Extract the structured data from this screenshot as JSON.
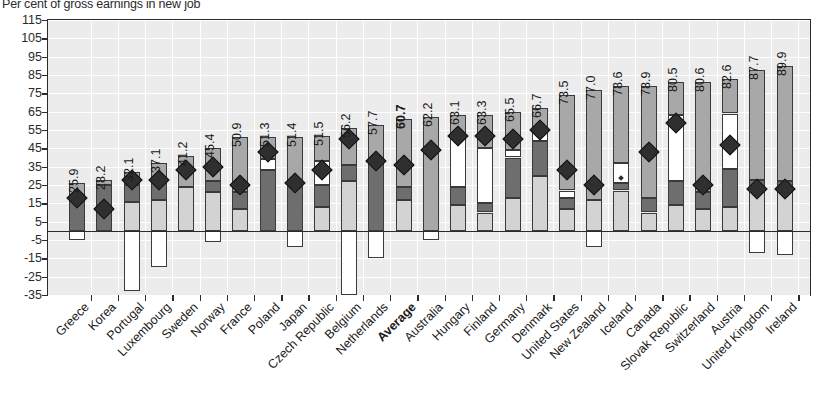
{
  "chart_data": {
    "type": "bar",
    "title": "Per cent of gross earnings in new job",
    "xlabel": "",
    "ylabel": "",
    "ylim": [
      -35,
      115
    ],
    "ytick_step": 10,
    "grid": true,
    "stacked": true,
    "legend_position": "below-chart",
    "ytick_labels": [
      "115",
      "105",
      "95",
      "85",
      "75",
      "65",
      "55",
      "45",
      "35",
      "25",
      "15",
      "5",
      "-5",
      "-15",
      "-25",
      "-35"
    ],
    "categories": [
      "Greece",
      "Korea",
      "Portugal",
      "Luxembourg",
      "Sweden",
      "Norway",
      "France",
      "Poland",
      "Japan",
      "Czech Republic",
      "Belgium",
      "Netherlands",
      "Average",
      "Australia",
      "Hungary",
      "Finland",
      "Germany",
      "Denmark",
      "United States",
      "New Zealand",
      "Iceland",
      "Canada",
      "Slovak Republic",
      "Switzerland",
      "Austria",
      "United Kingdom",
      "Ireland"
    ],
    "data_labels": [
      "25.9",
      "28.2",
      "32.1",
      "37.1",
      "41.2",
      "45.4",
      "50.9",
      "51.3",
      "51.4",
      "51.5",
      "56.2",
      "57.7",
      "60.7",
      "62.2",
      "63.1",
      "63.3",
      "65.5",
      "66.7",
      "73.5",
      "77.0",
      "78.6",
      "78.9",
      "80.5",
      "80.6",
      "82.6",
      "87.7",
      "89.9"
    ],
    "highlight_category": "Average",
    "series": [
      {
        "name": "negative-segment",
        "color": "#ffffff",
        "values": [
          -5.0,
          0.0,
          -33.0,
          -20.0,
          0.0,
          -6.0,
          0.0,
          0.0,
          -9.0,
          0.0,
          -35.0,
          -15.0,
          0.0,
          -5.0,
          0.0,
          0.0,
          0.0,
          0.0,
          0.0,
          -9.0,
          0.0,
          0.0,
          0.0,
          0.0,
          0.0,
          -12.0,
          -13.0
        ]
      },
      {
        "name": "segment-1-light",
        "color": "#d3d3d3",
        "values": [
          0.0,
          0.0,
          16.0,
          17.0,
          24.0,
          21.0,
          12.0,
          0.0,
          0.0,
          13.0,
          27.0,
          0.0,
          17.0,
          0.0,
          14.0,
          10.0,
          18.0,
          30.0,
          12.0,
          17.0,
          22.0,
          10.0,
          14.0,
          12.0,
          13.0,
          23.0,
          22.0
        ]
      },
      {
        "name": "segment-2-dark",
        "color": "#6e6e6e",
        "values": [
          19.0,
          25.0,
          9.0,
          9.0,
          0.0,
          6.0,
          9.0,
          33.0,
          25.0,
          12.0,
          9.0,
          37.0,
          7.0,
          0.0,
          10.0,
          5.0,
          22.0,
          19.0,
          6.0,
          0.0,
          4.0,
          8.0,
          13.0,
          9.0,
          21.0,
          5.0,
          5.0
        ]
      },
      {
        "name": "segment-3-white",
        "color": "#ffffff",
        "values": [
          0.0,
          0.0,
          0.0,
          0.0,
          0.0,
          0.0,
          0.0,
          6.0,
          0.0,
          13.0,
          0.0,
          0.0,
          0.0,
          0.0,
          26.0,
          30.0,
          4.0,
          7.0,
          4.0,
          0.0,
          11.0,
          0.0,
          36.0,
          0.0,
          30.0,
          0.0,
          0.0
        ]
      },
      {
        "name": "segment-4-mid",
        "color": "#a8a8a8",
        "values": [
          7.0,
          3.0,
          7.0,
          11.0,
          17.0,
          18.0,
          30.0,
          12.0,
          26.0,
          14.0,
          20.0,
          21.0,
          37.0,
          62.0,
          13.0,
          18.0,
          21.0,
          11.0,
          52.0,
          60.0,
          42.0,
          61.0,
          18.0,
          60.0,
          19.0,
          60.0,
          63.0
        ]
      }
    ],
    "marker_series": {
      "name": "diamond-marker",
      "symbol": "diamond",
      "color": "#2f2f2f",
      "values": [
        18.0,
        12.0,
        28.0,
        28.0,
        33.0,
        35.0,
        25.0,
        43.0,
        26.0,
        33.0,
        50.0,
        38.0,
        36.0,
        44.0,
        52.0,
        52.0,
        50.0,
        55.0,
        33.0,
        25.0,
        29.0,
        43.0,
        59.0,
        25.0,
        47.0,
        23.0,
        23.0
      ]
    }
  },
  "footnote": "",
  "ylabels": [
    "115",
    "105",
    "95",
    "85",
    "75",
    "65",
    "55",
    "45",
    "35",
    "25",
    "15",
    "5",
    "-5",
    "-15",
    "-25",
    "-35"
  ]
}
